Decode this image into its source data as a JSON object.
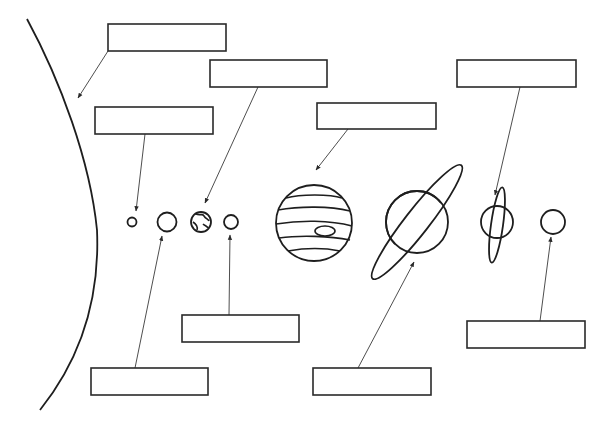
{
  "diagram": {
    "title": "",
    "type": "solar-system-labeling-worksheet",
    "stroke_color": "#1e1e1e",
    "background": "#ffffff"
  },
  "labels": [
    {
      "id": "sun",
      "text": ""
    },
    {
      "id": "mercury",
      "text": ""
    },
    {
      "id": "venus",
      "text": ""
    },
    {
      "id": "earth",
      "text": ""
    },
    {
      "id": "mars",
      "text": ""
    },
    {
      "id": "jupiter",
      "text": ""
    },
    {
      "id": "saturn",
      "text": ""
    },
    {
      "id": "uranus",
      "text": ""
    },
    {
      "id": "neptune",
      "text": ""
    }
  ]
}
